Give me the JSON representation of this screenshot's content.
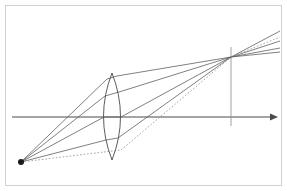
{
  "figure": {
    "type": "optical-ray-diagram",
    "width": 287,
    "height": 191,
    "background_color": "#ffffff",
    "frame": {
      "x": 5.5,
      "y": 5.5,
      "width": 276,
      "height": 180,
      "stroke": "#d0d0d0",
      "stroke_width": 1
    }
  },
  "chart_data": {
    "type": "scatter",
    "xlabel": "",
    "ylabel": "",
    "optical_axis": {
      "y": 117,
      "x_start": 12,
      "x_end": 272,
      "arrow_tip_x": 278,
      "stroke": "#4a4a4a",
      "stroke_width": 1
    },
    "image_plane": {
      "x": 231,
      "y_top": 47,
      "y_bottom": 126,
      "stroke": "#8a8a8a",
      "stroke_width": 0.8
    },
    "object_point": {
      "x": 21,
      "y": 162,
      "radius": 3,
      "fill": "#1a1a1a",
      "label": "object point source"
    },
    "image_point": {
      "x": 231,
      "y": 57,
      "label": "image convergence point"
    },
    "lens": {
      "center_x": 112,
      "center_y": 117,
      "top_vertex_y": 73,
      "bottom_vertex_y": 160,
      "half_width": 8.5,
      "stroke": "#4a4a4a",
      "stroke_width": 0.9,
      "fill": "none",
      "kind": "biconvex"
    },
    "rays": [
      {
        "name": "ray-1-upper-marginal",
        "style": "solid",
        "stroke": "#555555",
        "incoming": [
          [
            21,
            162
          ],
          [
            107,
            79
          ]
        ],
        "through_lens": [
          [
            107,
            79
          ],
          [
            117,
            76
          ]
        ],
        "outgoing": [
          [
            117,
            76
          ],
          [
            231,
            57
          ]
        ],
        "extended": [
          [
            231,
            57
          ],
          [
            280,
            48
          ]
        ]
      },
      {
        "name": "ray-2",
        "style": "solid",
        "stroke": "#555555",
        "incoming": [
          [
            21,
            162
          ],
          [
            105,
            96
          ]
        ],
        "through_lens": [
          [
            105,
            96
          ],
          [
            119,
            92
          ]
        ],
        "outgoing": [
          [
            119,
            92
          ],
          [
            231,
            57
          ]
        ],
        "extended": [
          [
            231,
            57
          ],
          [
            280,
            41
          ]
        ]
      },
      {
        "name": "ray-3-central",
        "style": "solid",
        "stroke": "#555555",
        "incoming": [
          [
            21,
            162
          ],
          [
            104,
            117
          ]
        ],
        "through_lens": [
          [
            104,
            117
          ],
          [
            121,
            117
          ]
        ],
        "outgoing": [
          [
            121,
            117
          ],
          [
            231,
            57
          ]
        ],
        "extended": [
          [
            231,
            57
          ],
          [
            280,
            31
          ]
        ]
      },
      {
        "name": "ray-4-lower-marginal",
        "style": "solid",
        "stroke": "#555555",
        "incoming": [
          [
            21,
            162
          ],
          [
            106,
            140
          ]
        ],
        "through_lens": [
          [
            106,
            140
          ],
          [
            118,
            138
          ]
        ],
        "outgoing": [
          [
            118,
            138
          ],
          [
            231,
            57
          ]
        ],
        "extended": [
          [
            231,
            57
          ],
          [
            280,
            52
          ]
        ]
      },
      {
        "name": "ray-5-dashed-undeviated",
        "style": "dashed",
        "stroke": "#9a9a9a",
        "incoming": [
          [
            21,
            162
          ],
          [
            104,
            152
          ]
        ],
        "through_lens": [
          [
            104,
            152
          ],
          [
            121,
            150
          ]
        ],
        "outgoing": [
          [
            121,
            150
          ],
          [
            231,
            57
          ]
        ],
        "extended": [
          [
            231,
            57
          ],
          [
            280,
            37
          ]
        ]
      }
    ],
    "legend": {
      "visible": false
    },
    "grid": false,
    "annotations": []
  }
}
